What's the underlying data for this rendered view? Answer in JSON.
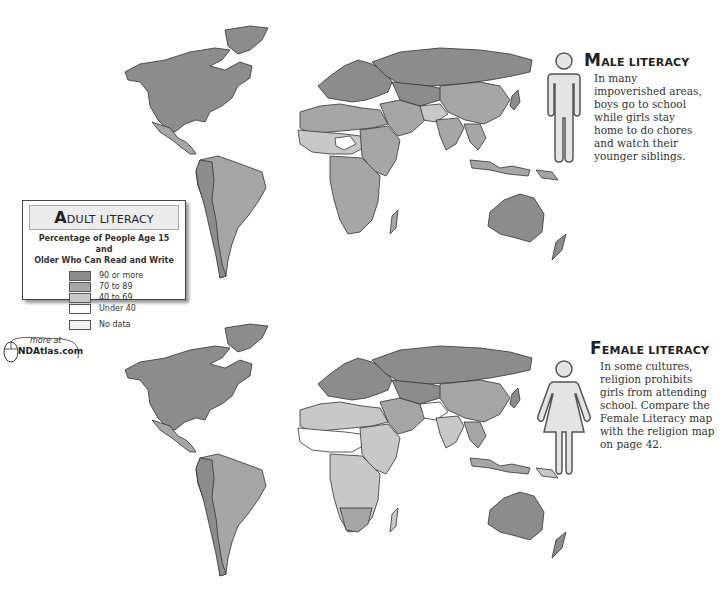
{
  "legend": {
    "title_initial": "A",
    "title_rest": "DULT LITERACY",
    "subtitle_line1": "Percentage of People Age 15 and",
    "subtitle_line2": "Older Who Can Read and Write",
    "items": [
      {
        "label": "90 or more",
        "color": "#8c8c8c"
      },
      {
        "label": "70 to 89",
        "color": "#a6a6a6"
      },
      {
        "label": "40 to 69",
        "color": "#c8c8c8"
      },
      {
        "label": "Under 40",
        "color": "#ffffff"
      },
      {
        "label": "No data",
        "color": "#f3f3f3"
      }
    ]
  },
  "more_link": {
    "line1": "more at",
    "line2": "NDAtlas.com",
    "icon": "mouse-icon"
  },
  "male": {
    "title_initial": "M",
    "title_rest": "ALE LITERACY",
    "body": "In many impoverished areas, boys go to school while girls stay home to do chores and watch their younger siblings.",
    "icon": "male-figure-icon"
  },
  "female": {
    "title_initial": "F",
    "title_rest": "EMALE LITERACY",
    "body": "In some cultures, religion prohibits girls from attending school. Compare the Female Literacy map with the religion map on page 42.",
    "icon": "female-figure-icon"
  },
  "colors": {
    "c90": "#8c8c8c",
    "c70": "#a6a6a6",
    "c40": "#c8c8c8",
    "under40": "#ffffff",
    "figure_fill": "#e4e4e4",
    "figure_stroke": "#555555"
  }
}
